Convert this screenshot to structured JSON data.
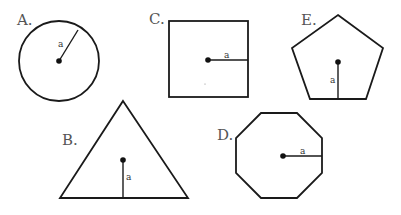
{
  "figures": [
    {
      "id": "A",
      "label": "A.",
      "shape": "circle",
      "radius_label": "a"
    },
    {
      "id": "B",
      "label": "B.",
      "shape": "triangle",
      "radius_label": "a"
    },
    {
      "id": "C",
      "label": "C.",
      "shape": "square",
      "radius_label": "a"
    },
    {
      "id": "D",
      "label": "D.",
      "shape": "octagon",
      "radius_label": "a"
    },
    {
      "id": "E",
      "label": "E.",
      "shape": "pentagon",
      "radius_label": "a"
    }
  ],
  "colors": {
    "stroke": "#1a1a1a",
    "label": "#555555",
    "background": "#ffffff"
  }
}
